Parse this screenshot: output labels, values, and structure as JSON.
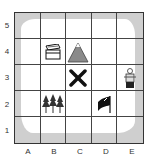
{
  "map": {
    "columns": [
      "A",
      "B",
      "C",
      "D",
      "E"
    ],
    "rows": [
      "5",
      "4",
      "3",
      "2",
      "1"
    ],
    "items": [
      {
        "name": "treasure-chest",
        "col": "B",
        "row": "4"
      },
      {
        "name": "mountain",
        "col": "C",
        "row": "4"
      },
      {
        "name": "x-mark",
        "col": "C",
        "row": "3"
      },
      {
        "name": "pirate",
        "col": "E",
        "row": "3"
      },
      {
        "name": "forest",
        "col": "B",
        "row": "2"
      },
      {
        "name": "flag",
        "col": "D",
        "row": "2"
      }
    ]
  },
  "labels": {
    "row_5": "5",
    "row_4": "4",
    "row_3": "3",
    "row_2": "2",
    "row_1": "1",
    "col_a": "A",
    "col_b": "B",
    "col_c": "C",
    "col_d": "D",
    "col_e": "E"
  }
}
